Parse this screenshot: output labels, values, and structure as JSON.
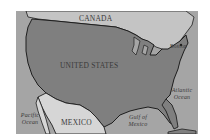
{
  "map": {
    "title": "United States and surrounding regions",
    "countries": [
      {
        "id": "canada",
        "label": "CANADA"
      },
      {
        "id": "united-states",
        "label": "UNITED STATES"
      },
      {
        "id": "mexico",
        "label": "MEXICO"
      }
    ],
    "water_bodies": [
      {
        "id": "pacific",
        "label": "Pacific Ocean"
      },
      {
        "id": "atlantic",
        "label": "Atlantic Ocean"
      },
      {
        "id": "gulf",
        "label": "Gulf of Mexico"
      }
    ],
    "cities": [
      {
        "id": "boston",
        "label": "Boston"
      }
    ],
    "colors": {
      "united_states": "#7f7f7f",
      "canada": "#c4c4c4",
      "mexico": "#d6d6d6",
      "ocean": "#a5a5a5",
      "border": "#1e1e1e",
      "label_text": "#3a3a3a"
    }
  }
}
